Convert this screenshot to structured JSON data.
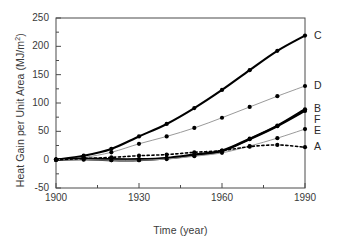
{
  "chart_data": {
    "type": "line",
    "title": "",
    "xlabel": "Time (year)",
    "ylabel_plain": "Heat Gain per Unit Area (MJ/m2)",
    "ylabel_prefix": "Heat Gain per Unit Area (MJ/m",
    "ylabel_exponent": "2",
    "ylabel_suffix": ")",
    "xlim": [
      1900,
      1990
    ],
    "ylim": [
      -50,
      250
    ],
    "xticks": [
      1900,
      1930,
      1960,
      1990
    ],
    "xtick_labels": [
      "1900",
      "1930",
      "1960",
      "1990"
    ],
    "xminor_ticks": [
      1915,
      1945,
      1975
    ],
    "yticks": [
      -50,
      0,
      50,
      100,
      150,
      200,
      250
    ],
    "ytick_labels": [
      "-50",
      "0",
      "50",
      "100",
      "150",
      "200",
      "250"
    ],
    "grid": false,
    "legend_position": "right-outside",
    "x": [
      1900,
      1910,
      1920,
      1930,
      1940,
      1950,
      1960,
      1970,
      1980,
      1990
    ],
    "series": [
      {
        "name": "C",
        "label": "C",
        "color": "#000000",
        "style": "solid",
        "width": 2.1,
        "marker": "circle",
        "values": [
          0,
          7,
          19,
          41,
          63,
          91,
          123,
          158,
          192,
          219
        ]
      },
      {
        "name": "D",
        "label": "D",
        "color": "#9a9a9a",
        "style": "solid",
        "width": 1.0,
        "marker": "circle",
        "values": [
          0,
          4,
          13,
          28,
          41,
          56,
          74,
          93,
          112,
          130
        ]
      },
      {
        "name": "B",
        "label": "B",
        "color": "#000000",
        "style": "solid",
        "width": 2.1,
        "marker": "circle",
        "values": [
          0,
          2,
          1,
          1,
          3,
          9,
          16,
          37,
          60,
          89
        ]
      },
      {
        "name": "F",
        "label": "F",
        "color": "#000000",
        "style": "solid",
        "width": 2.1,
        "marker": "circle",
        "values": [
          0,
          1,
          -1,
          -1,
          2,
          8,
          15,
          36,
          59,
          86
        ]
      },
      {
        "name": "E",
        "label": "E",
        "color": "#9a9a9a",
        "style": "solid",
        "width": 1.0,
        "marker": "circle",
        "values": [
          0,
          0,
          -1,
          -1,
          1,
          6,
          12,
          24,
          38,
          54
        ]
      },
      {
        "name": "A",
        "label": "A",
        "color": "#000000",
        "style": "dotted",
        "width": 1.6,
        "marker": "circle",
        "values": [
          0,
          2,
          4,
          7,
          9,
          13,
          16,
          23,
          26,
          22
        ]
      }
    ],
    "axis_color": "#4a4a4a",
    "background": "#ffffff"
  }
}
